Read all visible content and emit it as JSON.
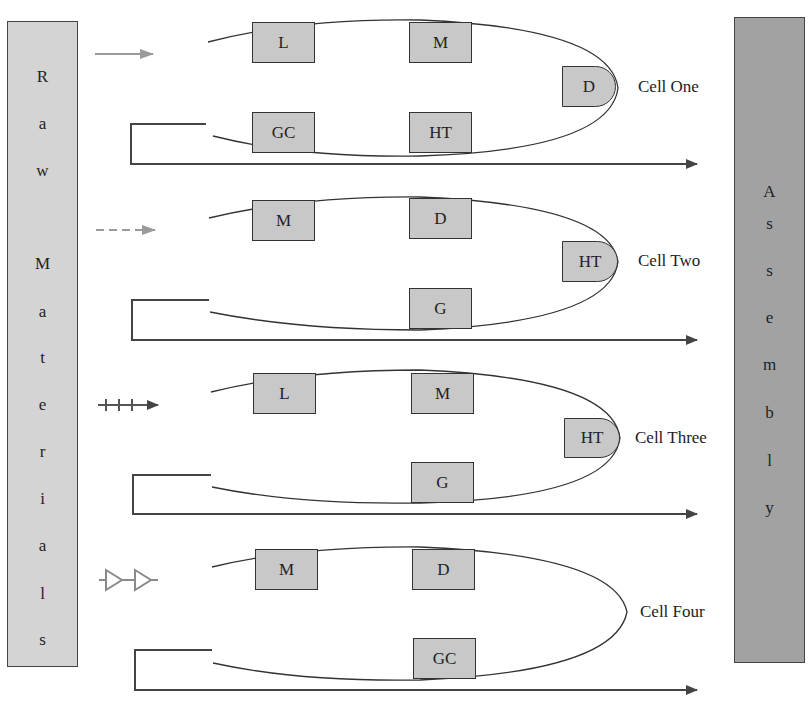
{
  "raw_materials": {
    "label": "Raw Materials",
    "letters": [
      "R",
      "a",
      "w",
      "",
      "M",
      "a",
      "t",
      "e",
      "r",
      "i",
      "a",
      "l",
      "s"
    ]
  },
  "assembly": {
    "label": "Assembly",
    "letters": [
      "A",
      "s",
      "s",
      "e",
      "m",
      "b",
      "l",
      "y"
    ]
  },
  "cells": [
    {
      "name": "Cell One",
      "input_arrow_style": "solid",
      "machines": [
        {
          "label": "L",
          "x": 252,
          "y": 22
        },
        {
          "label": "M",
          "x": 409,
          "y": 22
        },
        {
          "label": "D",
          "x": 562,
          "y": 66
        },
        {
          "label": "GC",
          "x": 252,
          "y": 112
        },
        {
          "label": "HT",
          "x": 409,
          "y": 112
        }
      ]
    },
    {
      "name": "Cell Two",
      "input_arrow_style": "dashed",
      "machines": [
        {
          "label": "M",
          "x": 252,
          "y": 200
        },
        {
          "label": "D",
          "x": 409,
          "y": 200
        },
        {
          "label": "HT",
          "x": 562,
          "y": 242
        },
        {
          "label": "G",
          "x": 409,
          "y": 288
        }
      ]
    },
    {
      "name": "Cell Three",
      "input_arrow_style": "plus",
      "machines": [
        {
          "label": "L",
          "x": 253,
          "y": 373
        },
        {
          "label": "M",
          "x": 411,
          "y": 373
        },
        {
          "label": "HT",
          "x": 564,
          "y": 418
        },
        {
          "label": "G",
          "x": 411,
          "y": 462
        }
      ]
    },
    {
      "name": "Cell Four",
      "input_arrow_style": "triangles",
      "machines": [
        {
          "label": "M",
          "x": 255,
          "y": 549
        },
        {
          "label": "D",
          "x": 412,
          "y": 549
        },
        {
          "label": "GC",
          "x": 413,
          "y": 638
        }
      ]
    }
  ],
  "colors": {
    "raw_fill": "#d4d4d4",
    "assembly_fill": "#a2a2a2",
    "machine_fill": "#c8c8c8",
    "input_arrow": "#9a9a9a",
    "line": "#444444"
  }
}
